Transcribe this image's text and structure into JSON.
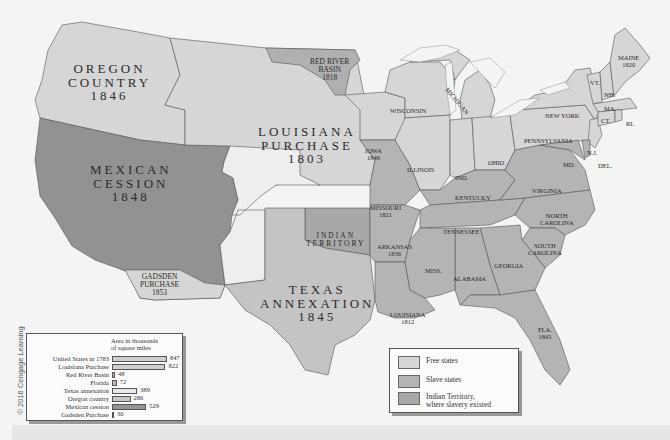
{
  "credit": "© 2016 Cengage Learning",
  "colors": {
    "free": "#d6d6d6",
    "slave": "#b4b4b4",
    "indian_territory": "#a8a8a8",
    "mexican_cession": "#929292",
    "unorganized": "#eeeeee",
    "water": "#f4f4f4",
    "border": "#555555"
  },
  "regions": {
    "oregon": {
      "line1": "OREGON",
      "line2": "COUNTRY",
      "year": "1846"
    },
    "mexican": {
      "line1": "MEXICAN",
      "line2": "CESSION",
      "year": "1848"
    },
    "louisiana": {
      "line1": "LOUISIANA",
      "line2": "PURCHASE",
      "year": "1803"
    },
    "texas": {
      "line1": "TEXAS",
      "line2": "ANNEXATION",
      "year": "1845"
    },
    "red_river": {
      "line1": "RED RIVER",
      "line2": "BASIN",
      "year": "1818"
    },
    "gadsden": {
      "line1": "GADSDEN",
      "line2": "PURCHASE",
      "year": "1853"
    },
    "indian": {
      "line1": "INDIAN",
      "line2": "TERRITORY"
    }
  },
  "states": {
    "maine": {
      "name": "MAINE",
      "year": "1820"
    },
    "vt": "VT.",
    "nh": "NH.",
    "ma": "MA.",
    "ct": "CT.",
    "ri": "RI.",
    "ny": "NEW YORK",
    "pa": "PENNSYLVANIA",
    "nj": "N.J.",
    "md": "MD.",
    "de": "DEL.",
    "wi": "WISCONSIN",
    "mi": "MICHIGAN",
    "ia": {
      "name": "IOWA",
      "year": "1846"
    },
    "il": "ILLINOIS",
    "in": "IND.",
    "oh": "OHIO",
    "mo": {
      "name": "MISSOURI",
      "year": "1821"
    },
    "ky": "KENTUCKY",
    "va": "VIRGINIA",
    "nc": {
      "line1": "NORTH",
      "line2": "CAROLINA"
    },
    "sc": {
      "line1": "SOUTH",
      "line2": "CAROLINA"
    },
    "tn": "TENNESSEE",
    "ar": {
      "name": "ARKANSAS",
      "year": "1836"
    },
    "ms": "MISS.",
    "al": "ALABAMA",
    "ga": "GEORGIA",
    "la": {
      "name": "LOUISIANA",
      "year": "1812"
    },
    "fl": {
      "name": "FLA.",
      "year": "1845"
    }
  },
  "chart_data": {
    "type": "bar",
    "title": "Area in thousands of square miles",
    "title_line1": "Area in thousands",
    "title_line2": "of square miles",
    "categories": [
      "United States in 1783",
      "Louisiana Purchase",
      "Red River Basin",
      "Florida",
      "Texas annexation",
      "Oregon country",
      "Mexican cession",
      "Gadsden Purchase"
    ],
    "values": [
      847,
      822,
      48,
      72,
      389,
      286,
      529,
      30
    ],
    "labels": [
      "847",
      "822",
      "48",
      "72",
      "389",
      "286",
      "529",
      "30"
    ],
    "orientation": "horizontal",
    "xlabel": "",
    "ylabel": ""
  },
  "legend": {
    "items": [
      {
        "label": "Free states",
        "color": "#d6d6d6"
      },
      {
        "label": "Slave states",
        "color": "#b4b4b4"
      },
      {
        "label_line1": "Indian Territory,",
        "label_line2": "where slavery existed",
        "color": "#a8a8a8"
      }
    ]
  }
}
